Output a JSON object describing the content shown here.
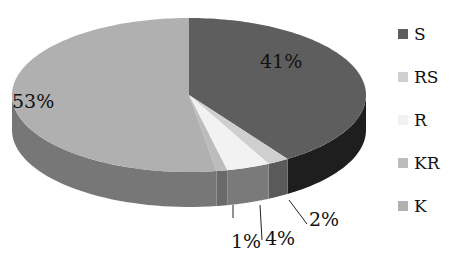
{
  "chart_data": {
    "type": "pie",
    "style": "3d",
    "title": "",
    "categories": [
      "S",
      "RS",
      "R",
      "KR",
      "K"
    ],
    "values": [
      41,
      2,
      4,
      1,
      53
    ],
    "labels": [
      "41%",
      "2%",
      "4%",
      "1%",
      "53%"
    ],
    "colors": [
      "#5e5e5e",
      "#cfcfcf",
      "#f2f2f2",
      "#bcbcbc",
      "#b0b0b0"
    ],
    "side_colors": [
      "#1e1e1e",
      "#5a5a5a",
      "#7a7a7a",
      "#6a6a6a",
      "#777777"
    ],
    "start_angle_deg": 0,
    "direction": "clockwise",
    "legend_position": "right"
  },
  "legend": {
    "items": [
      {
        "label": "S",
        "color": "#5e5e5e"
      },
      {
        "label": "RS",
        "color": "#cfcfcf"
      },
      {
        "label": "R",
        "color": "#f2f2f2"
      },
      {
        "label": "KR",
        "color": "#bcbcbc"
      },
      {
        "label": "K",
        "color": "#b0b0b0"
      }
    ]
  }
}
